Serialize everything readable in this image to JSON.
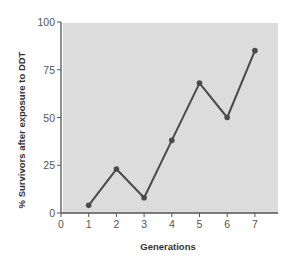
{
  "chart_data": {
    "type": "line",
    "title": "",
    "xlabel": "Generations",
    "ylabel": "% Survivors after exposure to DDT",
    "x": [
      1,
      2,
      3,
      4,
      5,
      6,
      7
    ],
    "series": [
      {
        "name": "% Survivors",
        "values": [
          4,
          23,
          8,
          38,
          68,
          50,
          85
        ]
      }
    ],
    "xticks": [
      0,
      1,
      2,
      3,
      4,
      5,
      6,
      7
    ],
    "yticks": [
      0,
      25,
      50,
      75,
      100
    ],
    "xlim": [
      0,
      7.8
    ],
    "ylim": [
      0,
      100
    ],
    "grid": false,
    "legend": "none"
  },
  "colors": {
    "plot_background": "#dcdcdc",
    "line": "#4a4a4a",
    "axis": "#555555"
  }
}
